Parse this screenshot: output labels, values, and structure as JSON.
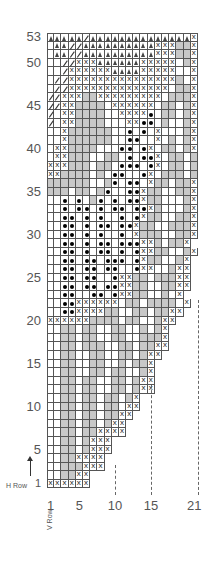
{
  "chart_data": {
    "type": "knitting-chart",
    "columns": 21,
    "rows": 53,
    "legend_codes": {
      ".": "blank",
      "g": "gray (contrast color)",
      "x": "x stitch",
      "o": "bobble/dot",
      "t": "triangle",
      "s": "slash",
      "e": "outside chart"
    },
    "y_tick_labels": [
      "53",
      "50",
      "45",
      "40",
      "35",
      "30",
      "25",
      "20",
      "15",
      "10",
      "5",
      "1"
    ],
    "y_tick_rows": [
      53,
      50,
      45,
      40,
      35,
      30,
      25,
      20,
      15,
      10,
      5,
      1
    ],
    "x_tick_labels": [
      "1",
      "5",
      "10",
      "15",
      "21"
    ],
    "x_tick_cols": [
      1,
      5,
      10,
      15,
      21
    ],
    "row_axis_label": "H Row",
    "col_axis_label": "V Row",
    "grid_rows_top_to_bottom": [
      "tttttsttttttttttttttx",
      ".ttssttttttttttxxxggx",
      ".ttssttttttttttxxxggx",
      "..ssxxxttttttxxxxx.gx",
      "..sxxxxxxttttxxxxx..x",
      ".ssxxxxxxxxxxxxxxxg.x",
      ".ssxxxxxxxxxxxxxx.ggx",
      "ssxxxggxxxxxxxxx.gggx",
      "ssxxgggg.xxxxxx.gg.gx",
      "s.xxgggg..xxxxo.gg.gx",
      "s.xxgggg...xxoo.g..gx",
      "..xgggggg..o.o.x...gx",
      "..xgggggg..oo..x.g.gx",
      ".xxgggg...oo.ox.gg.gx",
      ".xxggg..gg.o.oox.gg.gx",
      "xxxggg.gg.ooo.ox.gg.gx",
      "xxgggg.g.oo..ox.ggg.gx",
      "gggggg..go.oo.xgg.ggx",
      "ggg.gg.go..ooxgg..ggx",
      "..o.o.go.o.ooxgg...gx",
      "..o.oo.o.oo.ooxg...gx",
      "..oo.o.o..o.oxgg..ggx",
      "..oo.o.oo.ooxgg..gggx",
      "..oo.o.o..o.xggg..ggx",
      "..oo.o.oo.oooxxg.ggx",
      "..oo.o.oo.o.oxxgg..gx",
      "..oo.oo.ooo.oxgg..gx",
      "..oo.oo.oo..oxx..gxx",
      "..oo.oo..oxxgg.gggxx",
      "..oo.oo.ooxxgg..ggxx",
      "..oo..oo.oxxgg..g.xe",
      "..ooxxxxxx.gg.gggg.xe",
      "..ooxxxxgg..gg.ggxxe",
      "xxxxxxgggg.gg..gxxee",
      "..gg.gg..gg..g.gxee",
      "..gg.gg..gg..gggxee",
      "..gg.ggg..gg.ggxxee",
      "..gg..gg..gg.gxxeee",
      "..gg..gg..g.ggxeee",
      "..gg..gg.gg..gxeee",
      "..gg.gg..gg.gxxeee",
      "..gg.gg..gg.gxxeee",
      "..gg.gg.gg.gxeeeee",
      "..gg.gg.gg.xxeeeee",
      "..gg.gg.ggxxeeeeee",
      "..gg.gg.gxxeeeeeee",
      "..gg.ggxxxxeeeeeee",
      "..gg.gxxxeeeeeeeee",
      "..gg.gxxxeeeeeeeee",
      "..ggxxxxeeeeeeeeee",
      "..gggxxxeeeeeeeeee",
      "..ggxxeeeeeeeeeeee",
      "xxxxxxeeeeeeeeeeeee"
    ]
  }
}
